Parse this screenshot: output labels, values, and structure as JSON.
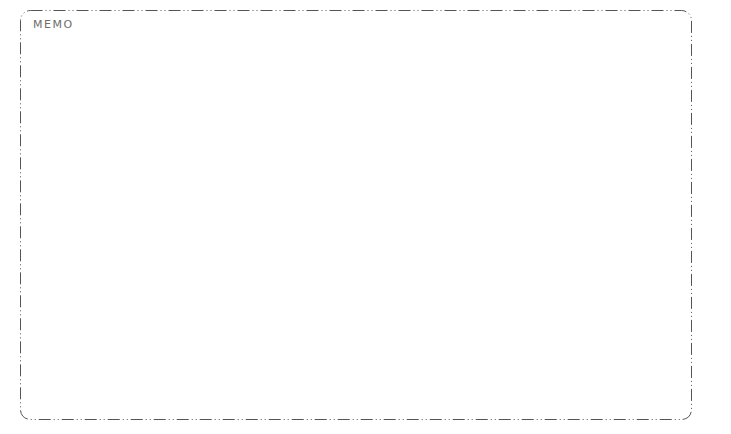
{
  "memo": {
    "label": "MEMO",
    "content": "",
    "border_color": "#555555",
    "label_color": "#6e6e6e"
  }
}
